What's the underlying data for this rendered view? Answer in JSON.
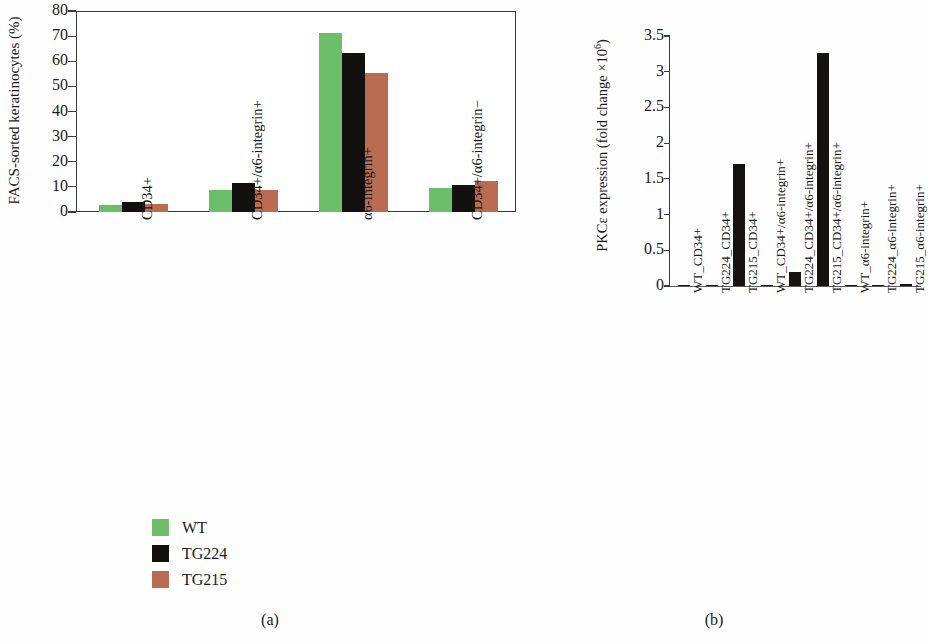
{
  "figure": {
    "panel_a_caption": "(a)",
    "panel_b_caption": "(b)"
  },
  "legend": {
    "items": [
      {
        "label": "WT",
        "color": "#6cbe6a"
      },
      {
        "label": "TG224",
        "color": "#131110"
      },
      {
        "label": "TG215",
        "color": "#bb6b52"
      }
    ]
  },
  "chart_data": [
    {
      "type": "bar",
      "panel": "(a)",
      "title": "",
      "xlabel": "",
      "ylabel": "FACS-sorted keratinocytes (%)",
      "ylim": [
        0,
        80
      ],
      "yticks": [
        0,
        10,
        20,
        30,
        40,
        50,
        60,
        70,
        80
      ],
      "grid": false,
      "legend_position": "below-left",
      "categories": [
        "CD34+",
        "CD34+/α6-integrin+",
        "α6-integrin+",
        "CD34+/α6-integrin−"
      ],
      "series": [
        {
          "name": "WT",
          "color": "#6cbe6a",
          "values": [
            2.6,
            8.6,
            71.3,
            9.4
          ]
        },
        {
          "name": "TG224",
          "color": "#131110",
          "values": [
            3.9,
            11.7,
            63.2,
            10.6
          ]
        },
        {
          "name": "TG215",
          "color": "#bb6b52",
          "values": [
            3.0,
            8.9,
            55.3,
            12.4
          ]
        }
      ]
    },
    {
      "type": "bar",
      "panel": "(b)",
      "title": "",
      "xlabel": "",
      "ylabel": "PKCε expression (fold change ×10⁶)",
      "ylabel_base": "PKCε expression (fold change ×10",
      "ylabel_sup": "6",
      "ylabel_tail": ")",
      "ylim": [
        0,
        3.5
      ],
      "yticks": [
        0,
        0.5,
        1,
        1.5,
        2,
        2.5,
        3,
        3.5
      ],
      "ytick_labels": [
        "0",
        "0.5",
        "1",
        "1.5",
        "2",
        "2.5",
        "3",
        "3.5"
      ],
      "grid": false,
      "legend_position": "none",
      "bar_color": "#151210",
      "categories": [
        "WT_CD34+",
        "TG224_CD34+",
        "TG215_CD34+",
        "WT_CD34+/α6-integrin+",
        "TG224_CD34+/α6-integrin+",
        "TG215_CD34+/α6-integrin+",
        "WT_α6-integrin+",
        "TG224_α6-integrin+",
        "TG215_α6-integrin+"
      ],
      "values": [
        0.005,
        0.01,
        1.71,
        0.01,
        0.19,
        3.26,
        0.005,
        0.02,
        0.03
      ]
    }
  ]
}
